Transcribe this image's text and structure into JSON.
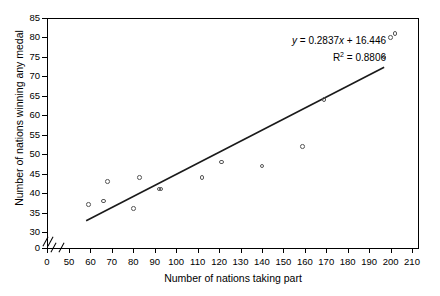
{
  "chart_data": {
    "type": "scatter",
    "title": "",
    "xlabel": "Number of nations taking part",
    "ylabel": "Number of nations winning any medal",
    "xlim": [
      47,
      212
    ],
    "ylim": [
      29,
      86
    ],
    "x_axis_break": true,
    "y_axis_break": true,
    "grid": false,
    "legend": false,
    "x_ticks": [
      0,
      50,
      60,
      70,
      80,
      90,
      100,
      110,
      120,
      130,
      140,
      150,
      160,
      170,
      180,
      190,
      200,
      210
    ],
    "y_ticks": [
      0,
      30,
      35,
      40,
      45,
      50,
      55,
      60,
      65,
      70,
      75,
      80,
      85
    ],
    "points": [
      {
        "x": 59,
        "y": 37
      },
      {
        "x": 66,
        "y": 38
      },
      {
        "x": 68,
        "y": 43
      },
      {
        "x": 80,
        "y": 36
      },
      {
        "x": 83,
        "y": 44
      },
      {
        "x": 92,
        "y": 41
      },
      {
        "x": 93,
        "y": 41
      },
      {
        "x": 112,
        "y": 44
      },
      {
        "x": 121,
        "y": 48
      },
      {
        "x": 140,
        "y": 47
      },
      {
        "x": 159,
        "y": 52
      },
      {
        "x": 169,
        "y": 64
      },
      {
        "x": 197,
        "y": 75
      },
      {
        "x": 200,
        "y": 80
      },
      {
        "x": 202,
        "y": 81
      }
    ],
    "trendline": {
      "slope": 0.2837,
      "intercept": 16.446,
      "r_squared": 0.8806,
      "x_start": 58,
      "x_end": 197
    },
    "annotations": {
      "equation_prefix": "y",
      "equation_body": " = 0.2837",
      "equation_var": "x",
      "equation_tail": " + 16.446",
      "r2_label": "R",
      "r2_sup": "2",
      "r2_value": " = 0.8806"
    }
  },
  "axis": {
    "x_tick_labels": [
      "0",
      "50",
      "60",
      "70",
      "80",
      "90",
      "100",
      "110",
      "120",
      "130",
      "140",
      "150",
      "160",
      "170",
      "180",
      "190",
      "200",
      "210"
    ],
    "y_tick_labels": [
      "0",
      "30",
      "35",
      "40",
      "45",
      "50",
      "55",
      "60",
      "65",
      "70",
      "75",
      "80",
      "85"
    ]
  },
  "colors": {
    "axis": "#000000",
    "marker_stroke": "#555555",
    "trendline": "#1a1a1a",
    "background": "#ffffff"
  }
}
